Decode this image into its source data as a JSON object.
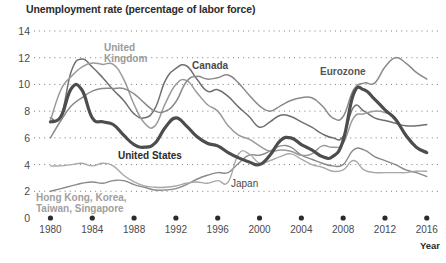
{
  "chart_data": {
    "type": "line",
    "title": "Unemployment rate (percentage of labor force)",
    "xlabel": "Year",
    "ylabel": "",
    "xlim": [
      1979,
      2016.5
    ],
    "ylim": [
      0,
      14
    ],
    "grid": "dotted-horizontal",
    "legend": "inline-annotations",
    "yticks": [
      "14",
      "12",
      "10",
      "8",
      "6",
      "4",
      "2",
      "0"
    ],
    "ytick_values": [
      14,
      12,
      10,
      8,
      6,
      4,
      2,
      0
    ],
    "xticks": [
      "1980",
      "1984",
      "1988",
      "1992",
      "1996",
      "2000",
      "2004",
      "2008",
      "2012",
      "2016"
    ],
    "xtick_values": [
      1980,
      1984,
      1988,
      1992,
      1996,
      2000,
      2004,
      2008,
      2012,
      2016
    ],
    "years": [
      1980,
      1981,
      1982,
      1983,
      1984,
      1985,
      1986,
      1987,
      1988,
      1989,
      1990,
      1991,
      1992,
      1993,
      1994,
      1995,
      1996,
      1997,
      1998,
      1999,
      2000,
      2001,
      2002,
      2003,
      2004,
      2005,
      2006,
      2007,
      2008,
      2009,
      2010,
      2011,
      2012,
      2013,
      2014,
      2015,
      2016
    ],
    "series": [
      {
        "name": "United States",
        "color": "#4d4d4d",
        "width": 3.2,
        "label_x": 118,
        "label_y": 156,
        "values": [
          7.2,
          7.6,
          9.7,
          9.6,
          7.5,
          7.2,
          7.0,
          6.2,
          5.5,
          5.3,
          5.6,
          6.8,
          7.5,
          6.9,
          6.1,
          5.6,
          5.4,
          4.9,
          4.5,
          4.2,
          4.0,
          4.7,
          5.8,
          6.0,
          5.5,
          5.1,
          4.6,
          4.6,
          5.8,
          9.3,
          9.6,
          8.9,
          8.1,
          7.4,
          6.2,
          5.3,
          4.9
        ]
      },
      {
        "name": "Canada",
        "color": "#6f6f6f",
        "width": 1.5,
        "label_x": 192,
        "label_y": 66,
        "values": [
          7.5,
          7.6,
          11.0,
          11.9,
          11.3,
          10.5,
          9.6,
          8.8,
          7.8,
          7.5,
          8.2,
          10.3,
          11.2,
          11.4,
          10.4,
          9.5,
          9.6,
          9.1,
          8.3,
          7.6,
          6.8,
          7.2,
          7.7,
          7.6,
          7.2,
          6.8,
          6.3,
          6.0,
          6.1,
          8.3,
          8.0,
          7.5,
          7.3,
          7.1,
          6.9,
          6.9,
          7.0
        ]
      },
      {
        "name": "United Kingdom",
        "color": "#9a9a9a",
        "width": 1.5,
        "label_x": 100,
        "label_y": 48,
        "values": [
          7.3,
          9.6,
          10.6,
          11.3,
          11.6,
          11.5,
          11.5,
          10.4,
          8.5,
          7.1,
          6.9,
          8.6,
          10.0,
          10.3,
          9.4,
          8.5,
          8.0,
          6.9,
          6.2,
          5.9,
          5.4,
          5.0,
          5.1,
          5.0,
          4.7,
          4.8,
          5.4,
          5.3,
          5.6,
          7.5,
          7.8,
          8.0,
          7.9,
          7.5,
          6.1,
          5.3,
          4.9
        ]
      },
      {
        "name": "Eurozone",
        "color": "#8a8a8a",
        "width": 1.5,
        "label_x": 322,
        "label_y": 70,
        "values": [
          6.0,
          7.3,
          8.4,
          9.0,
          9.5,
          9.7,
          9.7,
          9.7,
          9.3,
          8.6,
          8.0,
          8.0,
          8.7,
          10.2,
          10.6,
          10.4,
          10.5,
          10.7,
          10.1,
          9.2,
          8.4,
          8.0,
          8.4,
          8.8,
          9.0,
          9.0,
          8.4,
          7.5,
          7.6,
          9.6,
          10.1,
          10.1,
          11.3,
          12.0,
          11.6,
          10.9,
          10.4
        ]
      },
      {
        "name": "Japan",
        "color": "#8a8a8a",
        "width": 1.4,
        "label_x": 232,
        "label_y": 183,
        "values": [
          2.0,
          2.2,
          2.4,
          2.6,
          2.7,
          2.6,
          2.8,
          2.8,
          2.5,
          2.3,
          2.1,
          2.1,
          2.2,
          2.5,
          2.9,
          3.2,
          3.4,
          3.4,
          4.1,
          4.7,
          4.7,
          5.0,
          5.4,
          5.3,
          4.7,
          4.4,
          4.1,
          3.9,
          4.0,
          5.1,
          5.1,
          4.6,
          4.3,
          4.0,
          3.6,
          3.4,
          3.1
        ]
      },
      {
        "name": "Hong Kong, Korea, Taiwan, Singapore",
        "color": "#a8a8a8",
        "width": 1.4,
        "label_x": 36,
        "label_y": 197,
        "label_line1": "Hong Kong, Korea,",
        "label_line2": "Taiwan, Singapore",
        "values": [
          3.9,
          3.9,
          4.0,
          4.1,
          3.9,
          4.1,
          3.9,
          3.2,
          2.7,
          2.4,
          2.3,
          2.3,
          2.4,
          2.6,
          2.7,
          2.6,
          2.8,
          2.7,
          4.8,
          4.8,
          4.1,
          4.3,
          4.6,
          4.8,
          4.4,
          4.0,
          3.8,
          3.5,
          3.6,
          4.3,
          3.6,
          3.4,
          3.4,
          3.4,
          3.4,
          3.5,
          3.5
        ]
      }
    ]
  },
  "labels": {
    "united_states": "United States",
    "canada": "Canada",
    "united_kingdom_l1": "United",
    "united_kingdom_l2": "Kingdom",
    "eurozone": "Eurozone",
    "japan": "Japan",
    "tigers_l1": "Hong Kong, Korea,",
    "tigers_l2": "Taiwan, Singapore"
  }
}
